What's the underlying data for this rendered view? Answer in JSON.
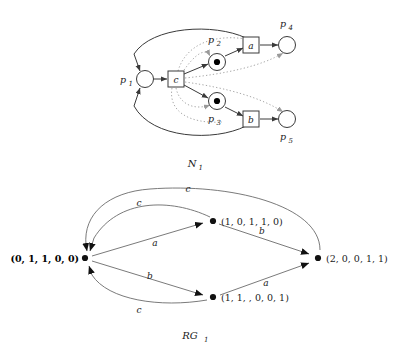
{
  "figure": {
    "kind": "petri-net-and-reachability-graph",
    "ink_color": "#3a3a3a",
    "token_color": "#000000",
    "background": "#ffffff"
  },
  "petri_net": {
    "caption": "N",
    "caption_sub": "1",
    "places": [
      {
        "id": "p1",
        "label": "p",
        "sub": "1",
        "tokens": 0,
        "x": 145,
        "y": 79
      },
      {
        "id": "p2",
        "label": "p",
        "sub": "2",
        "tokens": 1,
        "x": 217,
        "y": 62
      },
      {
        "id": "p3",
        "label": "p",
        "sub": "3",
        "tokens": 1,
        "x": 217,
        "y": 101
      },
      {
        "id": "p4",
        "label": "p",
        "sub": "4",
        "tokens": 0,
        "x": 287,
        "y": 45
      },
      {
        "id": "p5",
        "label": "p",
        "sub": "5",
        "tokens": 0,
        "x": 287,
        "y": 119
      }
    ],
    "transitions": [
      {
        "id": "c",
        "label": "c",
        "x": 176,
        "y": 79
      },
      {
        "id": "a",
        "label": "a",
        "x": 251,
        "y": 45
      },
      {
        "id": "b",
        "label": "b",
        "x": 251,
        "y": 119
      }
    ],
    "solid_arcs": [
      {
        "from": "p1",
        "to": "c"
      },
      {
        "from": "c",
        "to": "p2"
      },
      {
        "from": "c",
        "to": "p3"
      },
      {
        "from": "p2",
        "to": "a"
      },
      {
        "from": "p3",
        "to": "b"
      },
      {
        "from": "a",
        "to": "p4"
      },
      {
        "from": "b",
        "to": "p5"
      },
      {
        "from": "a",
        "to": "p1"
      },
      {
        "from": "b",
        "to": "p1"
      }
    ],
    "dotted_arcs": [
      {
        "from": "c",
        "to": "p4"
      },
      {
        "from": "c",
        "to": "p5"
      },
      {
        "from": "c",
        "to": "p2"
      },
      {
        "from": "c",
        "to": "p3"
      }
    ]
  },
  "reachability_graph": {
    "caption": "RG",
    "caption_sub": "1",
    "nodes": [
      {
        "id": "m0",
        "marking": "(0, 1, 1, 0, 0)",
        "bold": true,
        "x": 85,
        "y": 258,
        "label_anchor": "end",
        "label_x": 79,
        "label_y": 262
      },
      {
        "id": "m1",
        "marking": "(1, 0, 1, 1, 0)",
        "bold": false,
        "x": 213,
        "y": 221,
        "label_anchor": "start",
        "label_x": 221,
        "label_y": 225
      },
      {
        "id": "m2",
        "marking": "(1, 1, , 0, 0, 1)",
        "bold": false,
        "x": 213,
        "y": 297,
        "label_anchor": "start",
        "label_x": 221,
        "label_y": 301
      },
      {
        "id": "m3",
        "marking": "(2, 0, 0, 1, 1)",
        "bold": false,
        "x": 318,
        "y": 258,
        "label_anchor": "start",
        "label_x": 326,
        "label_y": 262
      }
    ],
    "edges": [
      {
        "from": "m0",
        "to": "m1",
        "label": "a",
        "label_x": 155,
        "label_y": 246
      },
      {
        "from": "m1",
        "to": "m3",
        "label": "b",
        "label_x": 262,
        "label_y": 234
      },
      {
        "from": "m0",
        "to": "m2",
        "label": "b",
        "label_x": 150,
        "label_y": 279
      },
      {
        "from": "m2",
        "to": "m3",
        "label": "a",
        "label_x": 266,
        "label_y": 286
      },
      {
        "from": "m1",
        "to": "m0",
        "label": "c",
        "label_x": 139,
        "label_y": 206
      },
      {
        "from": "m3",
        "to": "m0",
        "label": "c",
        "label_x": 188,
        "label_y": 192
      },
      {
        "from": "m2",
        "to": "m0",
        "label": "c",
        "label_x": 139,
        "label_y": 313
      }
    ]
  }
}
